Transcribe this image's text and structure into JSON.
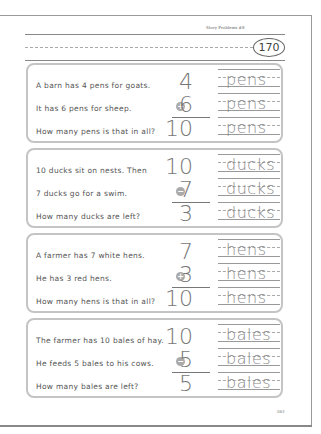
{
  "header": {
    "title": "Story Problems #8",
    "lesson_number": "170"
  },
  "problems": [
    {
      "sentences": [
        "A barn has 4 pens for goats.",
        "It has 6 pens for sheep.",
        "How many pens is that in all?"
      ],
      "top": "4",
      "operator": "+",
      "second": "6",
      "answer": "10",
      "unit": "pens"
    },
    {
      "sentences": [
        "10 ducks sit on nests. Then",
        "7 ducks go for a swim.",
        "How many ducks are left?"
      ],
      "top": "10",
      "operator": "−",
      "second": "7",
      "answer": "3",
      "unit": "ducks"
    },
    {
      "sentences": [
        "A farmer has 7 white hens.",
        "He has 3 red hens.",
        "How many hens is that in all?"
      ],
      "top": "7",
      "operator": "+",
      "second": "3",
      "answer": "10",
      "unit": "hens"
    },
    {
      "sentences": [
        "The farmer has 10 bales of hay.",
        "He feeds 5 bales to his cows.",
        "How many bales are left?"
      ],
      "top": "10",
      "operator": "−",
      "second": "5",
      "answer": "5",
      "unit": "bales"
    }
  ],
  "footer": {
    "page_number": "063"
  }
}
